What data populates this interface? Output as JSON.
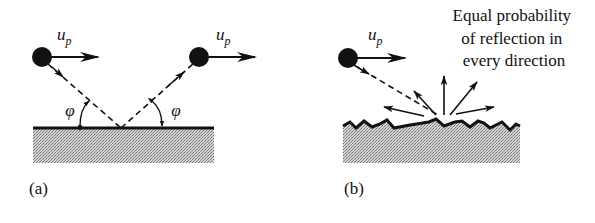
{
  "figure": {
    "panels": [
      {
        "id": "a",
        "caption": "(a)",
        "title": "Specular reflection",
        "velocity_label_main": "u",
        "velocity_label_sub": "p",
        "angle_label": "φ",
        "surface": "smooth"
      },
      {
        "id": "b",
        "caption": "(b)",
        "title": "Diffuse reflection",
        "velocity_label_main": "u",
        "velocity_label_sub": "p",
        "annotation_lines": [
          "Equal probability",
          "of reflection in",
          "every direction"
        ],
        "surface": "rough"
      }
    ],
    "colors": {
      "ink": "#111111",
      "hatch_light": "#d9d9d9",
      "hatch_dark": "#8a8a8a",
      "background": "#ffffff"
    }
  }
}
